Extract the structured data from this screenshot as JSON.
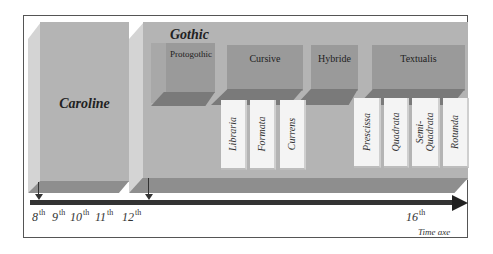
{
  "diagram": {
    "blocks": [
      {
        "id": "caroline",
        "label": "Caroline"
      },
      {
        "id": "gothic",
        "label": "Gothic"
      }
    ],
    "gothic_groups": [
      {
        "id": "protogothic",
        "label": "Protogothic"
      },
      {
        "id": "cursive",
        "label": "Cursive",
        "subtypes": [
          "Libraria",
          "Formata",
          "Currens"
        ]
      },
      {
        "id": "hybride",
        "label": "Hybride"
      },
      {
        "id": "textualis",
        "label": "Textualis",
        "subtypes": [
          "Prescissa",
          "Quadrata",
          "Semi-Quadrata",
          "Rotunda"
        ]
      }
    ],
    "timeline": {
      "ticks": [
        {
          "num": "8",
          "suffix": "th"
        },
        {
          "num": "9",
          "suffix": "th"
        },
        {
          "num": "10",
          "suffix": "th"
        },
        {
          "num": "11",
          "suffix": "th"
        },
        {
          "num": "12",
          "suffix": "th"
        },
        {
          "num": "16",
          "suffix": "th"
        }
      ],
      "axis_label": "Time axe"
    },
    "colors": {
      "block_front": "#b4b4b4",
      "block_side": "#d4d4d4",
      "block_floor": "#8e8e8e",
      "group_front": "#9a9a9a",
      "card": "#f4f4f4",
      "axis": "#333333"
    }
  }
}
